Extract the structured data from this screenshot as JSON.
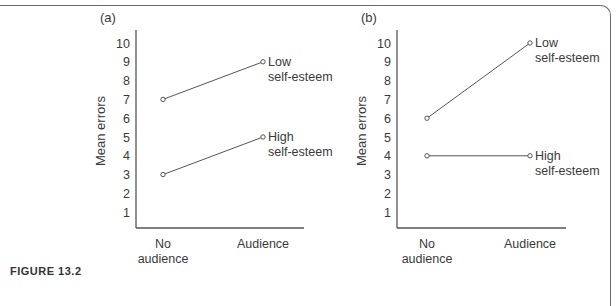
{
  "figure": {
    "caption": "FIGURE 13.2"
  },
  "chart_data": [
    {
      "type": "line",
      "panel_label": "(a)",
      "title": "",
      "xlabel": "",
      "ylabel": "Mean errors",
      "categories": [
        "No audience",
        "Audience"
      ],
      "x_tick_labels": [
        [
          "No",
          "audience"
        ],
        [
          "Audience"
        ]
      ],
      "y_ticks": [
        1,
        2,
        3,
        4,
        5,
        6,
        7,
        8,
        9,
        10
      ],
      "ylim": [
        0,
        10
      ],
      "grid": false,
      "legend": "inline labels at line ends",
      "series": [
        {
          "name": "Low self-esteem",
          "label_lines": [
            "Low",
            "self-esteem"
          ],
          "values": [
            7,
            9
          ]
        },
        {
          "name": "High self-esteem",
          "label_lines": [
            "High",
            "self-esteem"
          ],
          "values": [
            3,
            5
          ]
        }
      ]
    },
    {
      "type": "line",
      "panel_label": "(b)",
      "title": "",
      "xlabel": "",
      "ylabel": "Mean errors",
      "categories": [
        "No audience",
        "Audience"
      ],
      "x_tick_labels": [
        [
          "No",
          "audience"
        ],
        [
          "Audience"
        ]
      ],
      "y_ticks": [
        1,
        2,
        3,
        4,
        5,
        6,
        7,
        8,
        9,
        10
      ],
      "ylim": [
        0,
        10
      ],
      "grid": false,
      "legend": "inline labels at line ends",
      "series": [
        {
          "name": "Low self-esteem",
          "label_lines": [
            "Low",
            "self-esteem"
          ],
          "values": [
            6,
            10
          ]
        },
        {
          "name": "High self-esteem",
          "label_lines": [
            "High",
            "self-esteem"
          ],
          "values": [
            4,
            4
          ]
        }
      ]
    }
  ],
  "style": {
    "line_color": "#555555",
    "text_color": "#3a3a3a"
  }
}
